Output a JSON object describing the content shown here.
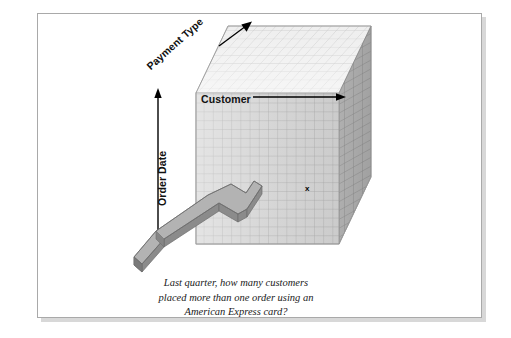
{
  "figure": {
    "type": "olap-cube-diagram",
    "background_color": "#ffffff",
    "frame_border_color": "#a9a9a9"
  },
  "axes": [
    {
      "id": "customer",
      "label": "Customer",
      "orientation": "horizontal",
      "arrow": "right-arrow-icon",
      "direction": "right"
    },
    {
      "id": "payment_type",
      "label": "Payment Type",
      "orientation": "diagonal",
      "arrow": "diagonal-arrow-icon",
      "direction": "up-right"
    },
    {
      "id": "order_date",
      "label": "Order Date",
      "orientation": "vertical",
      "arrow": "up-arrow-icon",
      "direction": "up"
    }
  ],
  "cube": {
    "front_face_color": "#d5d5d5",
    "right_face_color": "#b9b9b9",
    "top_face_color": "#ececec",
    "grid_line_color": "#9a9a9a",
    "front_grid_columns": 16,
    "front_grid_rows": 17,
    "depth_grid_steps": 15
  },
  "cell_marker": {
    "label": "x",
    "name": "selected-cell-marker",
    "color": "#000000"
  },
  "pointer_arrow": {
    "name": "query-pointer-arrow",
    "direction": "up-right",
    "top_color": "#b0b0b0",
    "side_color": "#8f8f8f",
    "front_color": "#9c9c9c",
    "outline_color": "#6e6e6e"
  },
  "caption": {
    "lines": [
      "Last quarter, how many customers",
      "placed more than one order using an",
      "American Express card?"
    ],
    "line1": "Last quarter, how many customers",
    "line2": "placed more than one order using an",
    "line3": "American Express card?"
  }
}
